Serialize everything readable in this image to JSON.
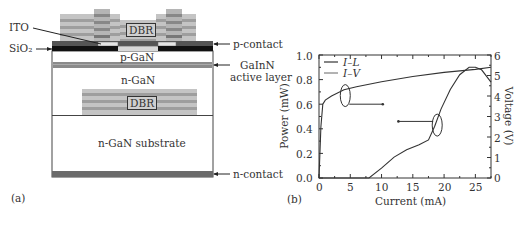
{
  "panel_a": {
    "label": "(a)",
    "layers": {
      "dbr_top": "DBR",
      "ito": "ITO",
      "sio2": "SiO₂",
      "p_contact": "p-contact",
      "p_gan": "p-GaN",
      "active_layer_line1": "GaInN",
      "active_layer_line2": "active layer",
      "n_gan": "n-GaN",
      "dbr_bottom": "DBR",
      "substrate": "n-GaN substrate",
      "n_contact": "n-contact"
    },
    "colors": {
      "dbr_light": "#c8c8c8",
      "dbr_dark": "#9a9a9a",
      "p_contact": "#555555",
      "sio2": "#111111",
      "ito": "#e6e6e6",
      "active": "#8a8a8a",
      "n_contact": "#6a6a6a"
    }
  },
  "panel_b": {
    "label": "(b)"
  },
  "chart_data": {
    "type": "line",
    "title": "",
    "xlabel": "Current (mA)",
    "ylabel": "Power (mW)",
    "y2label": "Voltage (V)",
    "xlim": [
      0,
      27.5
    ],
    "ylim": [
      0,
      1.0
    ],
    "y2lim": [
      0,
      6
    ],
    "xticks": [
      "0",
      "5",
      "10",
      "15",
      "20",
      "25"
    ],
    "yticks": [
      "0.0",
      "0.2",
      "0.4",
      "0.6",
      "0.8",
      "1.0"
    ],
    "y2ticks": [
      "0",
      "1",
      "2",
      "3",
      "4",
      "5",
      "6"
    ],
    "legend": [
      "I–L",
      "I–V"
    ],
    "legend_position": "upper left",
    "grid": false,
    "series": [
      {
        "name": "I–L",
        "axis": "left",
        "x": [
          0,
          8,
          10,
          12,
          14,
          16,
          17.5,
          18.5,
          19.5,
          21,
          22.5,
          24,
          25,
          26,
          27.5
        ],
        "y": [
          0,
          0,
          0.08,
          0.17,
          0.23,
          0.27,
          0.31,
          0.42,
          0.56,
          0.72,
          0.84,
          0.9,
          0.9,
          0.88,
          0.78
        ]
      },
      {
        "name": "I–V",
        "axis": "right",
        "x": [
          0,
          0.3,
          0.6,
          1,
          2,
          4,
          6,
          10,
          15,
          20,
          25,
          27.5
        ],
        "y": [
          0,
          2.5,
          3.6,
          3.8,
          4.0,
          4.3,
          4.45,
          4.7,
          4.95,
          5.15,
          5.3,
          5.4
        ]
      }
    ],
    "annotations": [
      {
        "type": "ellipse-arrow",
        "target": "I–V",
        "points_to": "right axis",
        "at_x": 4
      },
      {
        "type": "ellipse-arrow",
        "target": "I–L",
        "points_to": "left axis",
        "at_x": 19
      }
    ]
  }
}
